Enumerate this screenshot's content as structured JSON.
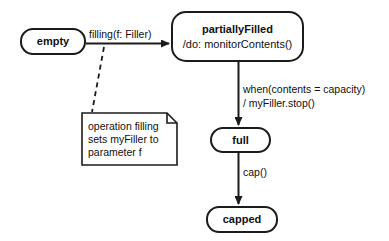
{
  "diagram": {
    "kind": "uml-state-machine-diagram",
    "stroke_color": "#1b1b1b",
    "text_color": "#101010",
    "background_color": "#ffffff",
    "states": [
      {
        "id": "empty",
        "name": "empty",
        "activity": ""
      },
      {
        "id": "partiallyFilled",
        "name": "partiallyFilled",
        "activity": "/do: monitorContents()"
      },
      {
        "id": "full",
        "name": "full",
        "activity": ""
      },
      {
        "id": "capped",
        "name": "capped",
        "activity": ""
      }
    ],
    "transitions": [
      {
        "id": "empty-to-partiallyFilled",
        "from": "empty",
        "to": "partiallyFilled",
        "label": "filling(f: Filler)",
        "style": "solid"
      },
      {
        "id": "partiallyFilled-to-full",
        "from": "partiallyFilled",
        "to": "full",
        "label_line1": "when(contents = capacity)",
        "label_line2": "/ myFiller.stop()",
        "style": "solid"
      },
      {
        "id": "full-to-capped",
        "from": "full",
        "to": "capped",
        "label": "cap()",
        "style": "solid"
      }
    ],
    "note": {
      "id": "note-filling",
      "line1": "operation filling",
      "line2": "sets myFiller to",
      "line3": "parameter f",
      "anchor_style": "dashed"
    }
  }
}
